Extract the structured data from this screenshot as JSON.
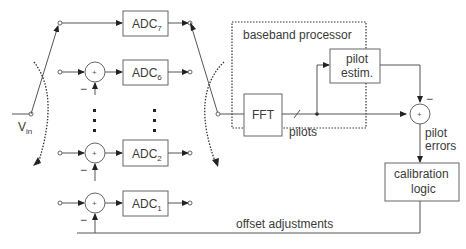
{
  "input": {
    "label": "V",
    "subscript": "in"
  },
  "adcs": [
    {
      "name": "ADC",
      "index": "7"
    },
    {
      "name": "ADC",
      "index": "6"
    },
    {
      "name": "ADC",
      "index": "2"
    },
    {
      "name": "ADC",
      "index": "1"
    }
  ],
  "summer": {
    "plus": "+",
    "minus": "−"
  },
  "baseband": {
    "title": "baseband processor",
    "fft": "FFT",
    "pilots": "pilots",
    "pilot_estim_line1": "pilot",
    "pilot_estim_line2": "estim."
  },
  "pilot_errors_line1": "pilot",
  "pilot_errors_line2": "errors",
  "calibration_line1": "calibration",
  "calibration_line2": "logic",
  "offset_adjustments": "offset adjustments"
}
